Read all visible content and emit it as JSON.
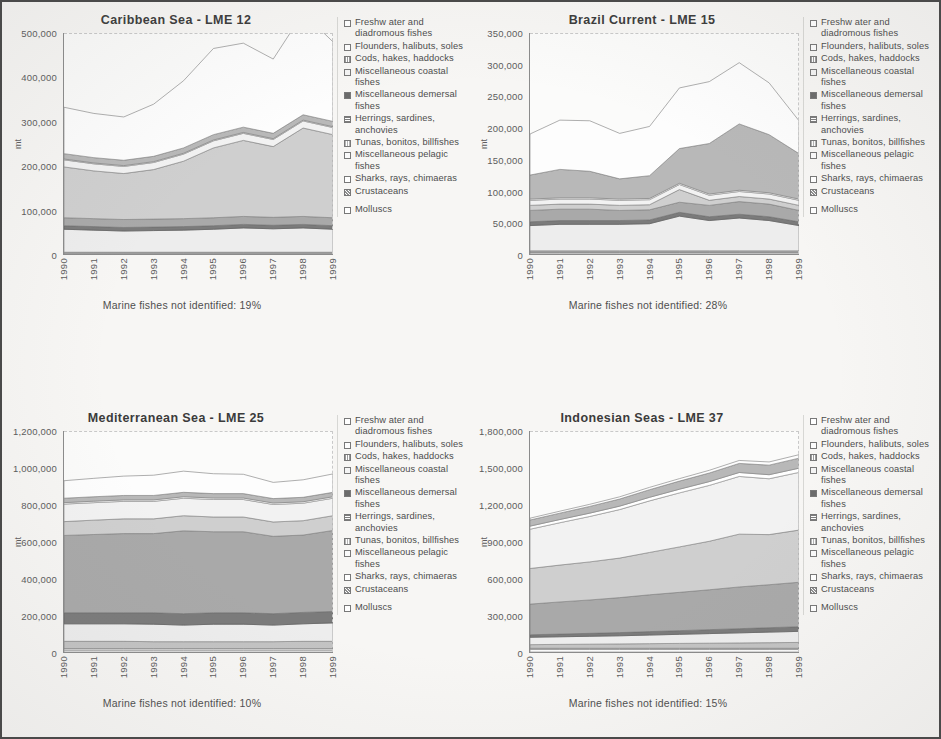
{
  "page": {
    "background_color": "#f7f6f4",
    "border_color": "#4a4a4a"
  },
  "legend": {
    "items": [
      {
        "label": "Freshw ater and diadromous fishes",
        "swatch": "sw-0"
      },
      {
        "label": "Flounders, halibuts, soles",
        "swatch": "sw-1"
      },
      {
        "label": "Cods, hakes, haddocks",
        "swatch": "sw-2"
      },
      {
        "label": "Miscellaneous coastal fishes",
        "swatch": "sw-3"
      },
      {
        "label": "Miscellaneous demersal fishes",
        "swatch": "sw-4"
      },
      {
        "label": "Herrings, sardines, anchovies",
        "swatch": "sw-5"
      },
      {
        "label": "Tunas, bonitos, billfishes",
        "swatch": "sw-6"
      },
      {
        "label": "Miscellaneous pelagic fishes",
        "swatch": "sw-7"
      },
      {
        "label": "Sharks, rays, chimaeras",
        "swatch": "sw-8"
      },
      {
        "label": "Crustaceans",
        "swatch": "sw-9"
      },
      {
        "label": "Molluscs",
        "swatch": "sw-10"
      }
    ]
  },
  "chart_data": [
    {
      "type": "area",
      "stacked": true,
      "title": "Caribbean Sea - LME 12",
      "xlabel": "",
      "ylabel": "mt",
      "ylim": [
        0,
        500000
      ],
      "yticks": [
        "0",
        "100,000",
        "200,000",
        "300,000",
        "400,000",
        "500,000"
      ],
      "ytick_values": [
        0,
        100000,
        200000,
        300000,
        400000,
        500000
      ],
      "grid": false,
      "legend_position": "right",
      "annotation": "Marine fishes not identified: 19%",
      "categories": [
        "1990",
        "1991",
        "1992",
        "1993",
        "1994",
        "1995",
        "1996",
        "1997",
        "1998",
        "1999"
      ],
      "series": [
        {
          "name": "Freshw ater and diadromous fishes",
          "values": [
            2000,
            2000,
            2000,
            2000,
            2000,
            2000,
            2000,
            2000,
            2000,
            2000
          ]
        },
        {
          "name": "Flounders, halibuts, soles",
          "values": [
            1000,
            1000,
            1000,
            1000,
            1000,
            1000,
            1000,
            1000,
            1000,
            1000
          ]
        },
        {
          "name": "Cods, hakes, haddocks",
          "values": [
            1000,
            1000,
            1000,
            1000,
            1000,
            1000,
            1000,
            1000,
            1000,
            1000
          ]
        },
        {
          "name": "Miscellaneous coastal fishes",
          "values": [
            52000,
            50000,
            48000,
            49000,
            50000,
            52000,
            55000,
            53000,
            55000,
            52000
          ]
        },
        {
          "name": "Miscellaneous demersal fishes",
          "values": [
            8000,
            8000,
            8000,
            8000,
            8000,
            8000,
            8000,
            8000,
            8000,
            8000
          ]
        },
        {
          "name": "Herrings, sardines, anchovies",
          "values": [
            18000,
            18000,
            18000,
            18000,
            18000,
            18000,
            18000,
            18000,
            18000,
            18000
          ]
        },
        {
          "name": "Tunas, bonitos, billfishes",
          "values": [
            115000,
            108000,
            104000,
            112000,
            130000,
            158000,
            172000,
            160000,
            200000,
            188000
          ]
        },
        {
          "name": "Miscellaneous pelagic fishes",
          "values": [
            16000,
            16000,
            16000,
            16000,
            16000,
            16000,
            16000,
            16000,
            16000,
            16000
          ]
        },
        {
          "name": "Sharks, rays, chimaeras",
          "values": [
            2000,
            2000,
            2000,
            2000,
            2000,
            2000,
            2000,
            2000,
            2000,
            2000
          ]
        },
        {
          "name": "Crustaceans",
          "values": [
            12000,
            12000,
            12000,
            12000,
            12000,
            12000,
            12000,
            12000,
            12000,
            12000
          ]
        },
        {
          "name": "Molluscs",
          "values": [
            105000,
            100000,
            98000,
            118000,
            152000,
            195000,
            190000,
            168000,
            230000,
            180000
          ]
        }
      ]
    },
    {
      "type": "area",
      "stacked": true,
      "title": "Brazil Current - LME 15",
      "xlabel": "",
      "ylabel": "mt",
      "ylim": [
        0,
        350000
      ],
      "yticks": [
        "0",
        "50,000",
        "100,000",
        "150,000",
        "200,000",
        "250,000",
        "300,000",
        "350,000"
      ],
      "ytick_values": [
        0,
        50000,
        100000,
        150000,
        200000,
        250000,
        300000,
        350000
      ],
      "grid": false,
      "legend_position": "right",
      "annotation": "Marine fishes not identified: 28%",
      "categories": [
        "1990",
        "1991",
        "1992",
        "1993",
        "1994",
        "1995",
        "1996",
        "1997",
        "1998",
        "1999"
      ],
      "series": [
        {
          "name": "Freshw ater and diadromous fishes",
          "values": [
            2000,
            2000,
            2000,
            2000,
            2000,
            2000,
            2000,
            2000,
            2000,
            2000
          ]
        },
        {
          "name": "Flounders, halibuts, soles",
          "values": [
            1000,
            1000,
            1000,
            1000,
            1000,
            1000,
            1000,
            1000,
            1000,
            1000
          ]
        },
        {
          "name": "Cods, hakes, haddocks",
          "values": [
            2000,
            2000,
            2000,
            2000,
            2000,
            2000,
            2000,
            2000,
            2000,
            2000
          ]
        },
        {
          "name": "Miscellaneous coastal fishes",
          "values": [
            40000,
            42000,
            42000,
            42000,
            43000,
            55000,
            48000,
            52000,
            48000,
            40000
          ]
        },
        {
          "name": "Miscellaneous demersal fishes",
          "values": [
            6000,
            6000,
            6000,
            6000,
            6000,
            6000,
            6000,
            6000,
            6000,
            6000
          ]
        },
        {
          "name": "Herrings, sardines, anchovies",
          "values": [
            18000,
            18000,
            18000,
            16000,
            16000,
            16000,
            18000,
            20000,
            20000,
            18000
          ]
        },
        {
          "name": "Tunas, bonitos, billfishes",
          "values": [
            8000,
            8000,
            8000,
            8000,
            8000,
            20000,
            8000,
            8000,
            8000,
            8000
          ]
        },
        {
          "name": "Miscellaneous pelagic fishes",
          "values": [
            8000,
            8000,
            8000,
            8000,
            8000,
            8000,
            8000,
            8000,
            8000,
            8000
          ]
        },
        {
          "name": "Sharks, rays, chimaeras",
          "values": [
            2000,
            2000,
            2000,
            2000,
            2000,
            2000,
            2000,
            2000,
            2000,
            2000
          ]
        },
        {
          "name": "Crustaceans",
          "values": [
            38000,
            45000,
            42000,
            32000,
            36000,
            55000,
            80000,
            105000,
            92000,
            72000
          ]
        },
        {
          "name": "Molluscs",
          "values": [
            65000,
            78000,
            80000,
            72000,
            78000,
            96000,
            98000,
            97000,
            82000,
            52000
          ]
        }
      ]
    },
    {
      "type": "area",
      "stacked": true,
      "title": "Mediterranean Sea - LME 25",
      "xlabel": "",
      "ylabel": "mt",
      "ylim": [
        0,
        1200000
      ],
      "yticks": [
        "0",
        "200,000",
        "400,000",
        "600,000",
        "800,000",
        "1,000,000",
        "1,200,000"
      ],
      "ytick_values": [
        0,
        200000,
        400000,
        600000,
        800000,
        1000000,
        1200000
      ],
      "grid": false,
      "legend_position": "right",
      "annotation": "Marine fishes not identified: 10%",
      "categories": [
        "1990",
        "1991",
        "1992",
        "1993",
        "1994",
        "1995",
        "1996",
        "1997",
        "1998",
        "1999"
      ],
      "series": [
        {
          "name": "Freshw ater and diadromous fishes",
          "values": [
            10000,
            10000,
            10000,
            10000,
            10000,
            10000,
            10000,
            10000,
            10000,
            10000
          ]
        },
        {
          "name": "Flounders, halibuts, soles",
          "values": [
            8000,
            8000,
            8000,
            8000,
            8000,
            8000,
            8000,
            8000,
            8000,
            8000
          ]
        },
        {
          "name": "Cods, hakes, haddocks",
          "values": [
            40000,
            40000,
            40000,
            38000,
            38000,
            38000,
            38000,
            38000,
            40000,
            40000
          ]
        },
        {
          "name": "Miscellaneous coastal fishes",
          "values": [
            95000,
            95000,
            95000,
            95000,
            90000,
            95000,
            95000,
            90000,
            95000,
            100000
          ]
        },
        {
          "name": "Miscellaneous demersal fishes",
          "values": [
            60000,
            60000,
            60000,
            62000,
            62000,
            62000,
            62000,
            62000,
            62000,
            62000
          ]
        },
        {
          "name": "Herrings, sardines, anchovies",
          "values": [
            420000,
            425000,
            430000,
            430000,
            450000,
            440000,
            440000,
            420000,
            420000,
            440000
          ]
        },
        {
          "name": "Tunas, bonitos, billfishes",
          "values": [
            75000,
            78000,
            80000,
            80000,
            82000,
            80000,
            80000,
            78000,
            78000,
            80000
          ]
        },
        {
          "name": "Miscellaneous pelagic fishes",
          "values": [
            95000,
            95000,
            95000,
            95000,
            95000,
            95000,
            95000,
            95000,
            95000,
            95000
          ]
        },
        {
          "name": "Sharks, rays, chimaeras",
          "values": [
            8000,
            8000,
            8000,
            8000,
            8000,
            8000,
            8000,
            8000,
            8000,
            8000
          ]
        },
        {
          "name": "Crustaceans",
          "values": [
            24000,
            24000,
            24000,
            24000,
            24000,
            24000,
            24000,
            24000,
            24000,
            24000
          ]
        },
        {
          "name": "Molluscs",
          "values": [
            95000,
            100000,
            105000,
            110000,
            115000,
            108000,
            105000,
            88000,
            95000,
            100000
          ]
        }
      ]
    },
    {
      "type": "area",
      "stacked": true,
      "title": "Indonesian Seas - LME 37",
      "xlabel": "",
      "ylabel": "mt",
      "ylim": [
        0,
        1800000
      ],
      "yticks": [
        "0",
        "300,000",
        "600,000",
        "900,000",
        "1,200,000",
        "1,500,000",
        "1,800,000"
      ],
      "ytick_values": [
        0,
        300000,
        600000,
        900000,
        1200000,
        1500000,
        1800000
      ],
      "grid": false,
      "legend_position": "right",
      "annotation": "Marine fishes not identified: 15%",
      "categories": [
        "1990",
        "1991",
        "1992",
        "1993",
        "1994",
        "1995",
        "1996",
        "1997",
        "1998",
        "1999"
      ],
      "series": [
        {
          "name": "Freshw ater and diadromous fishes",
          "values": [
            20000,
            20000,
            20000,
            20000,
            20000,
            20000,
            20000,
            20000,
            20000,
            20000
          ]
        },
        {
          "name": "Flounders, halibuts, soles",
          "values": [
            10000,
            10000,
            10000,
            10000,
            10000,
            10000,
            10000,
            10000,
            10000,
            10000
          ]
        },
        {
          "name": "Cods, hakes, haddocks",
          "values": [
            30000,
            32000,
            34000,
            36000,
            38000,
            40000,
            42000,
            44000,
            46000,
            48000
          ]
        },
        {
          "name": "Miscellaneous coastal fishes",
          "values": [
            60000,
            62000,
            64000,
            66000,
            70000,
            74000,
            78000,
            82000,
            86000,
            90000
          ]
        },
        {
          "name": "Miscellaneous demersal fishes",
          "values": [
            20000,
            22000,
            24000,
            26000,
            28000,
            30000,
            32000,
            34000,
            36000,
            38000
          ]
        },
        {
          "name": "Herrings, sardines, anchovies",
          "values": [
            250000,
            262000,
            272000,
            285000,
            300000,
            312000,
            325000,
            340000,
            350000,
            362000
          ]
        },
        {
          "name": "Tunas, bonitos, billfishes",
          "values": [
            290000,
            300000,
            310000,
            322000,
            345000,
            370000,
            395000,
            430000,
            408000,
            425000
          ]
        },
        {
          "name": "Miscellaneous pelagic fishes",
          "values": [
            320000,
            345000,
            370000,
            395000,
            420000,
            440000,
            455000,
            470000,
            455000,
            470000
          ]
        },
        {
          "name": "Sharks, rays, chimaeras",
          "values": [
            25000,
            26000,
            27000,
            28000,
            29000,
            30000,
            31000,
            32000,
            33000,
            34000
          ]
        },
        {
          "name": "Crustaceans",
          "values": [
            50000,
            52000,
            55000,
            58000,
            62000,
            66000,
            70000,
            74000,
            78000,
            82000
          ]
        },
        {
          "name": "Molluscs",
          "values": [
            15000,
            16000,
            17000,
            18000,
            19000,
            20000,
            22000,
            24000,
            26000,
            28000
          ]
        }
      ]
    }
  ]
}
